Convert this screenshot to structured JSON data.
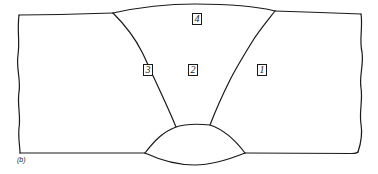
{
  "figure": {
    "caption": "(b)",
    "line_color": "#1a1a1a",
    "background": "#ffffff"
  },
  "labels": [
    {
      "id": "pass-1",
      "text": "1",
      "region": "right parent plate / heat-affected zone"
    },
    {
      "id": "pass-2",
      "text": "2",
      "region": "weld center"
    },
    {
      "id": "pass-3",
      "text": "3",
      "region": "left fusion boundary"
    },
    {
      "id": "pass-4",
      "text": "4",
      "region": "cap / top reinforcement"
    }
  ]
}
